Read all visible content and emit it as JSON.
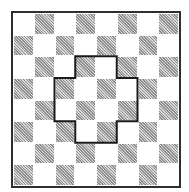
{
  "diagram": {
    "type": "checkerboard-with-outlined-region",
    "rows": 8,
    "cols": 8,
    "first_cell_color": "light",
    "colors": {
      "background": "#ffffff",
      "light_cell": "#ffffff",
      "dark_cell": "#b0b0b0",
      "border": "#2e2e2e",
      "outline": "#1a1a1a"
    },
    "outlined_region": {
      "shape": "cross",
      "cells": [
        [
          2,
          3
        ],
        [
          2,
          4
        ],
        [
          3,
          2
        ],
        [
          3,
          3
        ],
        [
          3,
          4
        ],
        [
          3,
          5
        ],
        [
          4,
          2
        ],
        [
          4,
          3
        ],
        [
          4,
          4
        ],
        [
          4,
          5
        ],
        [
          5,
          3
        ],
        [
          5,
          4
        ]
      ]
    }
  }
}
